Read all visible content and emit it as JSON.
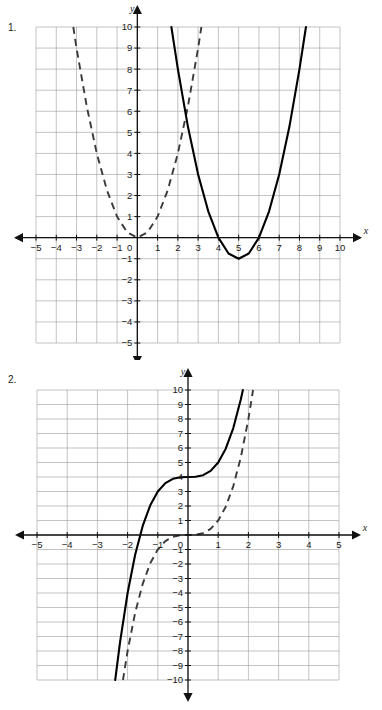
{
  "page": {
    "background_color": "#ffffff",
    "width": 382,
    "height": 710
  },
  "problems": [
    {
      "number": "1.",
      "axis_x_name": "x",
      "axis_y_name": "y",
      "x_labels": [
        "-5",
        "-4",
        "-3",
        "-2",
        "-1",
        "0",
        "1",
        "2",
        "3",
        "4",
        "5",
        "6",
        "7",
        "8",
        "9",
        "10"
      ],
      "y_labels": [
        "10",
        "9",
        "8",
        "7",
        "6",
        "5",
        "4",
        "3",
        "2",
        "1",
        "-1",
        "-2",
        "-3",
        "-4",
        "-5"
      ],
      "zero_label": "0"
    },
    {
      "number": "2.",
      "axis_x_name": "x",
      "axis_y_name": "y",
      "x_labels": [
        "-5",
        "-4",
        "-3",
        "-2",
        "-1",
        "0",
        "1",
        "2",
        "3",
        "4",
        "5"
      ],
      "y_labels": [
        "10",
        "9",
        "8",
        "7",
        "6",
        "5",
        "4",
        "3",
        "2",
        "1",
        "-1",
        "-2",
        "-3",
        "-4",
        "-5",
        "-6",
        "-7",
        "-8",
        "-9",
        "-10"
      ],
      "zero_label": "0"
    }
  ],
  "chart_data": [
    {
      "type": "line",
      "title": "Problem 1 - Quadratic functions",
      "xlabel": "x",
      "ylabel": "y",
      "xlim": [
        -5,
        10
      ],
      "ylim": [
        -5,
        10
      ],
      "xticks": [
        -5,
        -4,
        -3,
        -2,
        -1,
        0,
        1,
        2,
        3,
        4,
        5,
        6,
        7,
        8,
        9,
        10
      ],
      "yticks": [
        -5,
        -4,
        -3,
        -2,
        -1,
        0,
        1,
        2,
        3,
        4,
        5,
        6,
        7,
        8,
        9,
        10
      ],
      "grid": true,
      "legend": "none",
      "series": [
        {
          "name": "parent function y = x^2",
          "style": "dashed",
          "color": "#3a3a3a",
          "equation": "y = x^2",
          "vertex": [
            0,
            0
          ],
          "points": [
            [
              -3.16,
              10
            ],
            [
              -3,
              9
            ],
            [
              -2.5,
              6.25
            ],
            [
              -2,
              4
            ],
            [
              -1.5,
              2.25
            ],
            [
              -1,
              1
            ],
            [
              -0.5,
              0.25
            ],
            [
              0,
              0
            ],
            [
              0.5,
              0.25
            ],
            [
              1,
              1
            ],
            [
              1.5,
              2.25
            ],
            [
              2,
              4
            ],
            [
              2.5,
              6.25
            ],
            [
              3,
              9
            ],
            [
              3.16,
              10
            ]
          ]
        },
        {
          "name": "transformed function y = (x-5)^2 - 1",
          "style": "solid",
          "color": "#000000",
          "equation": "y = (x - 5)^2 - 1",
          "vertex": [
            5,
            -1
          ],
          "roots": [
            4,
            6
          ],
          "points": [
            [
              1.68,
              10
            ],
            [
              2,
              8
            ],
            [
              2.5,
              5.25
            ],
            [
              3,
              3
            ],
            [
              3.5,
              1.25
            ],
            [
              4,
              0
            ],
            [
              4.5,
              -0.75
            ],
            [
              5,
              -1
            ],
            [
              5.5,
              -0.75
            ],
            [
              6,
              0
            ],
            [
              6.5,
              1.25
            ],
            [
              7,
              3
            ],
            [
              7.5,
              5.25
            ],
            [
              8,
              8
            ],
            [
              8.32,
              10
            ]
          ]
        }
      ]
    },
    {
      "type": "line",
      "title": "Problem 2 - Cubic functions",
      "xlabel": "x",
      "ylabel": "y",
      "xlim": [
        -5,
        5
      ],
      "ylim": [
        -10,
        10
      ],
      "xticks": [
        -5,
        -4,
        -3,
        -2,
        -1,
        0,
        1,
        2,
        3,
        4,
        5
      ],
      "yticks": [
        -10,
        -9,
        -8,
        -7,
        -6,
        -5,
        -4,
        -3,
        -2,
        -1,
        0,
        1,
        2,
        3,
        4,
        5,
        6,
        7,
        8,
        9,
        10
      ],
      "grid": true,
      "legend": "none",
      "series": [
        {
          "name": "parent function y = x^3",
          "style": "dashed",
          "color": "#3a3a3a",
          "equation": "y = x^3",
          "inflection": [
            0,
            0
          ],
          "points": [
            [
              -2.154,
              -10
            ],
            [
              -2,
              -8
            ],
            [
              -1.75,
              -5.36
            ],
            [
              -1.5,
              -3.375
            ],
            [
              -1.25,
              -1.95
            ],
            [
              -1,
              -1
            ],
            [
              -0.75,
              -0.42
            ],
            [
              -0.5,
              -0.125
            ],
            [
              -0.25,
              -0.016
            ],
            [
              0,
              0
            ],
            [
              0.25,
              0.016
            ],
            [
              0.5,
              0.125
            ],
            [
              0.75,
              0.42
            ],
            [
              1,
              1
            ],
            [
              1.25,
              1.95
            ],
            [
              1.5,
              3.375
            ],
            [
              1.75,
              5.36
            ],
            [
              2,
              8
            ],
            [
              2.154,
              10
            ]
          ]
        },
        {
          "name": "transformed function y = x^3 + 4",
          "style": "solid",
          "color": "#000000",
          "equation": "y = x^3 + 4",
          "inflection": [
            0,
            4
          ],
          "points": [
            [
              -2.41,
              -10
            ],
            [
              -2.25,
              -7.39
            ],
            [
              -2,
              -4
            ],
            [
              -1.75,
              -1.36
            ],
            [
              -1.5,
              0.625
            ],
            [
              -1.25,
              2.05
            ],
            [
              -1,
              3
            ],
            [
              -0.75,
              3.58
            ],
            [
              -0.5,
              3.875
            ],
            [
              -0.25,
              3.98
            ],
            [
              0,
              4
            ],
            [
              0.25,
              4.016
            ],
            [
              0.5,
              4.125
            ],
            [
              0.75,
              4.42
            ],
            [
              1,
              5
            ],
            [
              1.25,
              5.95
            ],
            [
              1.5,
              7.375
            ],
            [
              1.75,
              9.36
            ],
            [
              1.817,
              10
            ]
          ]
        }
      ]
    }
  ]
}
